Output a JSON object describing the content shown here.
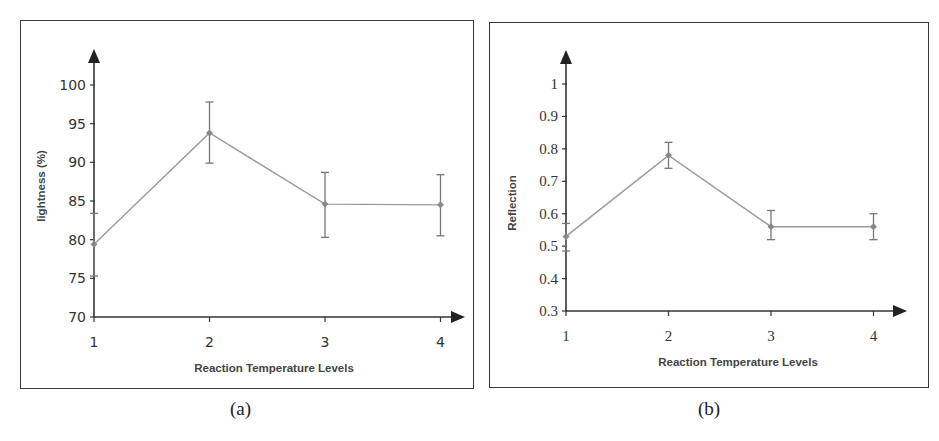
{
  "figure": {
    "captions": [
      "(a)",
      "(b)"
    ]
  },
  "chart_data": [
    {
      "type": "line",
      "panel": "(a)",
      "title": "",
      "xlabel": "Reaction Temperature Levels",
      "ylabel": "lightness (%)",
      "categories": [
        "1",
        "2",
        "3",
        "4"
      ],
      "x": [
        1,
        2,
        3,
        4
      ],
      "values": [
        79.4,
        93.8,
        84.6,
        84.5
      ],
      "error_upper": [
        83.4,
        97.8,
        88.7,
        88.4
      ],
      "error_lower": [
        75.3,
        89.9,
        80.3,
        80.5
      ],
      "yticks": [
        "70",
        "75",
        "80",
        "85",
        "90",
        "95",
        "100"
      ],
      "ylim": [
        70,
        100
      ],
      "grid": false,
      "legend": null,
      "line_color": "#9a9a9a",
      "marker_color": "#8a8a8a"
    },
    {
      "type": "line",
      "panel": "(b)",
      "title": "",
      "xlabel": "Reaction Temperature Levels",
      "ylabel": "Reflection",
      "categories": [
        "1",
        "2",
        "3",
        "4"
      ],
      "x": [
        1,
        2,
        3,
        4
      ],
      "values": [
        0.53,
        0.78,
        0.56,
        0.56
      ],
      "error_upper": [
        0.57,
        0.82,
        0.61,
        0.6
      ],
      "error_lower": [
        0.485,
        0.74,
        0.52,
        0.52
      ],
      "yticks": [
        "0.3",
        "0.4",
        "0.5",
        "0.6",
        "0.7",
        "0.8",
        "0.9",
        "1"
      ],
      "ylim": [
        0.3,
        1.0
      ],
      "grid": false,
      "legend": null,
      "line_color": "#9a9a9a",
      "marker_color": "#8a8a8a"
    }
  ]
}
